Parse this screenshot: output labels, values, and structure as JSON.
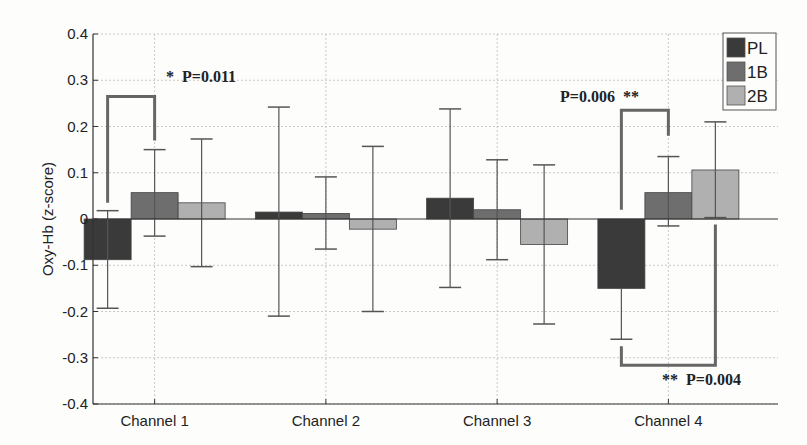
{
  "chart_data": {
    "type": "bar",
    "title": "",
    "xlabel": "",
    "ylabel": "Oxy-Hb (z-score)",
    "ylim": [
      -0.4,
      0.4
    ],
    "yticks": [
      0.4,
      0.3,
      0.2,
      0.1,
      0,
      -0.1,
      -0.2,
      -0.3,
      -0.4
    ],
    "ytick_labels": [
      "0.4",
      "0.3",
      "0.2",
      "0.1",
      "0",
      "-0.1",
      "-0.2",
      "-0.3",
      "-0.4"
    ],
    "grid": true,
    "legend_position": "upper right",
    "categories": [
      "Channel 1",
      "Channel 2",
      "Channel 3",
      "Channel 4"
    ],
    "series": [
      {
        "name": "PL",
        "color": "#3a3a3a",
        "values": [
          -0.088,
          0.015,
          0.045,
          -0.15
        ],
        "err_low": [
          -0.193,
          -0.21,
          -0.148,
          -0.26
        ],
        "err_high": [
          0.018,
          0.242,
          0.238,
          -0.26
        ]
      },
      {
        "name": "1B",
        "color": "#6e6e6e",
        "values": [
          0.057,
          0.012,
          0.02,
          0.057
        ],
        "err_low": [
          -0.037,
          -0.065,
          -0.088,
          -0.015
        ],
        "err_high": [
          0.15,
          0.091,
          0.128,
          0.135
        ]
      },
      {
        "name": "2B",
        "color": "#b0b0b0",
        "values": [
          0.035,
          -0.022,
          -0.055,
          0.106
        ],
        "err_low": [
          -0.103,
          -0.2,
          -0.227,
          0.003
        ],
        "err_high": [
          0.173,
          0.157,
          0.117,
          0.21
        ]
      }
    ],
    "annotations": [
      {
        "text": "*  P=0.011",
        "channel": "Channel 1",
        "between": [
          "PL",
          "1B"
        ]
      },
      {
        "text": "P=0.006  **",
        "channel": "Channel 4",
        "between": [
          "PL",
          "1B"
        ]
      },
      {
        "text": "**  P=0.004",
        "channel": "Channel 4",
        "between": [
          "PL",
          "2B"
        ]
      }
    ]
  },
  "legend": {
    "items": [
      "PL",
      "1B",
      "2B"
    ]
  },
  "annotations": {
    "a1": "*  P=0.011",
    "a2": "P=0.006  **",
    "a3": "**  P=0.004"
  }
}
